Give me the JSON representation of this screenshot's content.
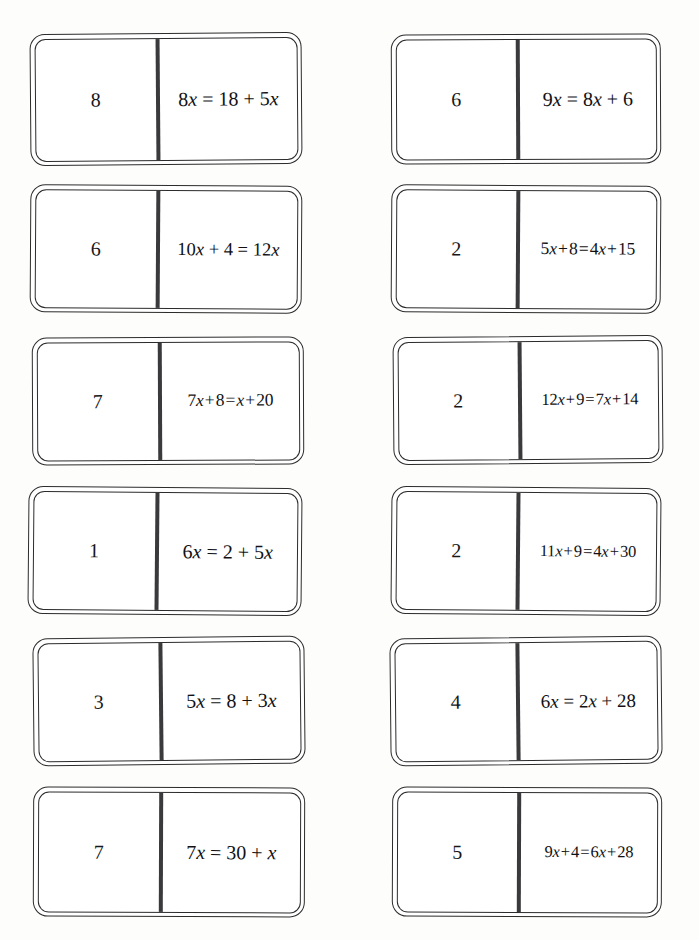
{
  "page": {
    "background_color": "#fdfdfc",
    "ink_color": "#2c2c2c",
    "divider_color": "#3a3a3d",
    "columns": 2,
    "rows": 6,
    "tile_count": 12
  },
  "tiles": {
    "left": [
      {
        "answer": "8",
        "equation": "8x = 18 + 5x",
        "spacing": "loose",
        "lhs": "8x",
        "rhs": "18 + 5x",
        "terms": {
          "a": 8,
          "b": 0,
          "c": 18,
          "d": 5
        }
      },
      {
        "answer": "6",
        "equation": "10x + 4 = 12x",
        "spacing": "loose",
        "lhs": "10x + 4",
        "rhs": "12x",
        "terms": {
          "a": 10,
          "b": 4,
          "c": 0,
          "d": 12
        }
      },
      {
        "answer": "7",
        "equation": "7x + 8 = x + 20",
        "spacing": "tight",
        "lhs": "7x + 8",
        "rhs": "x + 20",
        "terms": {
          "a": 7,
          "b": 8,
          "c": 20,
          "d": 1
        }
      },
      {
        "answer": "1",
        "equation": "6x = 2 + 5x",
        "spacing": "loose",
        "lhs": "6x",
        "rhs": "2 + 5x",
        "terms": {
          "a": 6,
          "b": 0,
          "c": 2,
          "d": 5
        }
      },
      {
        "answer": "3",
        "equation": "5x = 8 + 3x",
        "spacing": "loose",
        "lhs": "5x",
        "rhs": "8 + 3x",
        "terms": {
          "a": 5,
          "b": 0,
          "c": 8,
          "d": 3
        }
      },
      {
        "answer": "7",
        "equation": "7x = 30 + x",
        "spacing": "loose",
        "lhs": "7x",
        "rhs": "30 + x",
        "terms": {
          "a": 7,
          "b": 0,
          "c": 30,
          "d": 1
        }
      }
    ],
    "right": [
      {
        "answer": "6",
        "equation": "9x = 8x + 6",
        "spacing": "loose",
        "lhs": "9x",
        "rhs": "8x + 6",
        "terms": {
          "a": 9,
          "b": 0,
          "c": 6,
          "d": 8
        }
      },
      {
        "answer": "2",
        "equation": "5x + 8 = 4x + 15",
        "spacing": "tight",
        "lhs": "5x + 8",
        "rhs": "4x + 15",
        "terms": {
          "a": 5,
          "b": 8,
          "c": 15,
          "d": 4
        }
      },
      {
        "answer": "2",
        "equation": "12x + 9 = 7x + 14",
        "spacing": "tight",
        "lhs": "12x + 9",
        "rhs": "7x + 14",
        "terms": {
          "a": 12,
          "b": 9,
          "c": 14,
          "d": 7
        }
      },
      {
        "answer": "2",
        "equation": "11x + 9 = 4x + 30",
        "spacing": "tight",
        "lhs": "11x + 9",
        "rhs": "4x + 30",
        "terms": {
          "a": 11,
          "b": 9,
          "c": 30,
          "d": 4
        }
      },
      {
        "answer": "4",
        "equation": "6x = 2x + 28",
        "spacing": "loose",
        "lhs": "6x",
        "rhs": "2x + 28",
        "terms": {
          "a": 6,
          "b": 0,
          "c": 28,
          "d": 2
        }
      },
      {
        "answer": "5",
        "equation": "9x + 4 = 6x + 28",
        "spacing": "tight",
        "lhs": "9x + 4",
        "rhs": "6x + 28",
        "terms": {
          "a": 9,
          "b": 4,
          "c": 28,
          "d": 6
        }
      }
    ]
  }
}
